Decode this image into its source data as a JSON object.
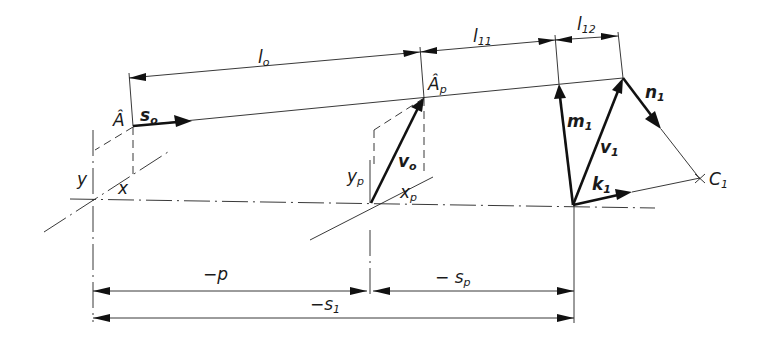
{
  "figure": {
    "type": "technical optics/vector construction diagram",
    "colors": {
      "line": "#222222",
      "background": "#ffffff"
    }
  },
  "labels": {
    "A_hat": {
      "main": "Â",
      "sub": ""
    },
    "A_hat_p": {
      "main": "Â",
      "sub": "p"
    },
    "s0": {
      "main": "s",
      "sub": "o"
    },
    "l0": {
      "main": "l",
      "sub": "o"
    },
    "l11": {
      "main": "l",
      "sub": "11"
    },
    "l12": {
      "main": "l",
      "sub": "12"
    },
    "m1": {
      "main": "m",
      "sub": "1"
    },
    "v0": {
      "main": "v",
      "sub": "o"
    },
    "v1": {
      "main": "v",
      "sub": "1"
    },
    "n1": {
      "main": "n",
      "sub": "1"
    },
    "k1": {
      "main": "k",
      "sub": "1"
    },
    "C1": {
      "main": "C",
      "sub": "1"
    },
    "y": {
      "main": "y",
      "sub": ""
    },
    "x": {
      "main": "x",
      "sub": ""
    },
    "yp": {
      "main": "y",
      "sub": "p"
    },
    "xp": {
      "main": "x",
      "sub": "p"
    },
    "minus_p": {
      "main": "−p",
      "sub": ""
    },
    "minus_sp": {
      "main": "− s",
      "sub": "p"
    },
    "minus_s1": {
      "main": "−s",
      "sub": "1"
    }
  },
  "dimensions": [
    {
      "id": "l0",
      "label": "l_o",
      "from": "Â",
      "to": "Â_p"
    },
    {
      "id": "l11",
      "label": "l_11",
      "from": "Â_p",
      "to": "m1 top"
    },
    {
      "id": "l12",
      "label": "l_12",
      "from": "m1 top",
      "to": "v1 top"
    },
    {
      "id": "minus_p",
      "label": "−p",
      "from": "origin y",
      "to": "origin y_p"
    },
    {
      "id": "minus_sp",
      "label": "−s_p",
      "from": "origin y_p",
      "to": "origin k1"
    },
    {
      "id": "minus_s1",
      "label": "−s_1",
      "from": "origin y",
      "to": "origin k1"
    }
  ],
  "vectors": [
    {
      "id": "s0",
      "label": "s_o",
      "bold": true
    },
    {
      "id": "v0",
      "label": "v_o",
      "bold": true
    },
    {
      "id": "m1",
      "label": "m_1",
      "bold": true
    },
    {
      "id": "v1",
      "label": "v_1",
      "bold": true
    },
    {
      "id": "n1",
      "label": "n_1",
      "bold": true
    },
    {
      "id": "k1",
      "label": "k_1",
      "bold": true
    }
  ]
}
